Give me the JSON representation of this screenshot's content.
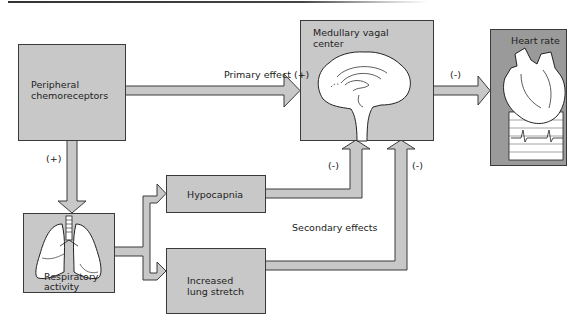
{
  "diagram": {
    "type": "flowchart",
    "colors": {
      "box_fill": "#c8c8c8",
      "heart_box_fill": "#9a9a9a",
      "arrow_fill": "#c8c8c8",
      "stroke": "#3a3a3a",
      "background": "#ffffff"
    },
    "nodes": {
      "peripheral": {
        "label_line1": "Peripheral",
        "label_line2": "chemoreceptors"
      },
      "medullary": {
        "label_line1": "Medullary vagal",
        "label_line2": "center",
        "icon": "brain-icon"
      },
      "heart": {
        "label": "Heart rate",
        "icon": "heart-icon"
      },
      "respiratory": {
        "label_line1": "Respiratory",
        "label_line2": "activity",
        "icon": "lungs-icon"
      },
      "hypocapnia": {
        "label": "Hypocapnia"
      },
      "lung_stretch": {
        "label_line1": "Increased",
        "label_line2": "lung stretch"
      }
    },
    "edges": {
      "primary": {
        "label": "Primary effect (+)"
      },
      "to_heart": {
        "label": "(-)"
      },
      "to_respiratory": {
        "label": "(+)"
      },
      "hypocapnia_to_medullary": {
        "label": "(-)"
      },
      "stretch_to_medullary": {
        "label": "(-)"
      },
      "secondary": {
        "label": "Secondary effects"
      }
    }
  }
}
